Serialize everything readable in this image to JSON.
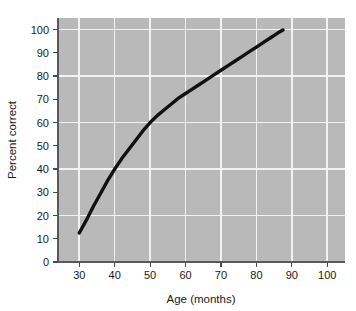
{
  "chart_data": {
    "type": "line",
    "title": "",
    "xlabel": "Age (months)",
    "ylabel": "Percent correct",
    "xlim": [
      24,
      105
    ],
    "ylim": [
      0,
      105
    ],
    "grid": true,
    "legend": null,
    "x_ticks": [
      30,
      40,
      50,
      60,
      70,
      80,
      90,
      100
    ],
    "x_tick_labels": [
      "30",
      "40",
      "50",
      "60",
      "70",
      "80",
      "90",
      "100"
    ],
    "y_ticks": [
      0,
      10,
      20,
      30,
      40,
      50,
      60,
      70,
      80,
      90,
      100
    ],
    "y_tick_labels": [
      "0",
      "10",
      "20",
      "30",
      "40",
      "50",
      "60",
      "70",
      "80",
      "90",
      "100"
    ],
    "x_gridlines": [
      30,
      40,
      50,
      60,
      70,
      80,
      90,
      100
    ],
    "y_gridlines": [
      20,
      40,
      60,
      80,
      100
    ],
    "plot_background_color": "#b9b9b9",
    "gridline_color": "#f2f2f2",
    "curve_color": "#111111",
    "series": [
      {
        "name": "Percent correct",
        "x": [
          30,
          32,
          34,
          36,
          38,
          40,
          42,
          44,
          46,
          48,
          50,
          52,
          54,
          56,
          58,
          60,
          62,
          64,
          66,
          68,
          70,
          72,
          74,
          76,
          78,
          80,
          82,
          84,
          86,
          87.5
        ],
        "values": [
          12.5,
          18,
          24,
          29.5,
          35,
          40,
          44.5,
          48.5,
          52.5,
          56.5,
          60,
          63,
          65.5,
          68,
          70.5,
          72.5,
          74.5,
          76.5,
          78.5,
          80.5,
          82.5,
          84.5,
          86.5,
          88.5,
          90.5,
          92.5,
          94.5,
          96.5,
          98.5,
          99.8
        ]
      }
    ]
  },
  "axes": {
    "x_axis_title": "Age (months)",
    "y_axis_title": "Percent correct"
  }
}
